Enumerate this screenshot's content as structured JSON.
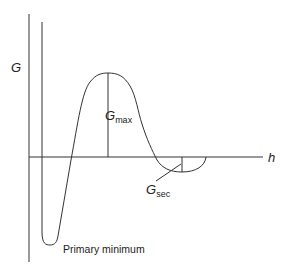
{
  "diagram": {
    "type": "potential-energy-curve",
    "y_axis_label": "G",
    "x_axis_label": "h",
    "labels": {
      "g_max": {
        "main": "G",
        "sub": "max"
      },
      "g_sec": {
        "main": "G",
        "sub": "sec"
      },
      "primary_minimum": "Primary minimum"
    },
    "colors": {
      "line": "#333333",
      "background": "#ffffff"
    }
  }
}
